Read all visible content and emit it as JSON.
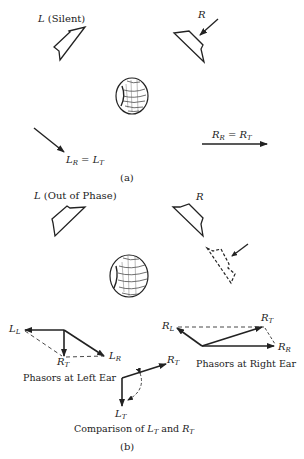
{
  "panel_a": {
    "caption": "(a)",
    "left_speaker_label": "L",
    "left_speaker_note": "(Silent)",
    "right_speaker_label": "R",
    "left_phasor": {
      "main": "L",
      "sub1": "R",
      "eq": " = ",
      "main2": "L",
      "sub2": "T"
    },
    "right_phasor": {
      "main": "R",
      "sub1": "R",
      "eq": " = ",
      "main2": "R",
      "sub2": "T"
    }
  },
  "panel_b": {
    "caption": "(b)",
    "left_speaker_label": "L",
    "left_speaker_note": "(Out of Phase)",
    "right_speaker_label": "R",
    "left_ear": {
      "title": "Phasors at Left Ear",
      "LL": {
        "main": "L",
        "sub": "L"
      },
      "RT": {
        "main": "R",
        "sub": "T"
      },
      "LR": {
        "main": "L",
        "sub": "R"
      }
    },
    "right_ear": {
      "title": "Phasors at Right Ear",
      "RL": {
        "main": "R",
        "sub": "L"
      },
      "RT": {
        "main": "R",
        "sub": "T"
      },
      "RR": {
        "main": "R",
        "sub": "R"
      }
    },
    "comparison": {
      "title_prefix": "Comparison of ",
      "a": {
        "main": "L",
        "sub": "T"
      },
      "and": " and ",
      "b": {
        "main": "R",
        "sub": "T"
      },
      "RT": {
        "main": "R",
        "sub": "T"
      },
      "LT": {
        "main": "L",
        "sub": "T"
      }
    }
  },
  "colors": {
    "ink": "#222222",
    "background": "#ffffff"
  }
}
